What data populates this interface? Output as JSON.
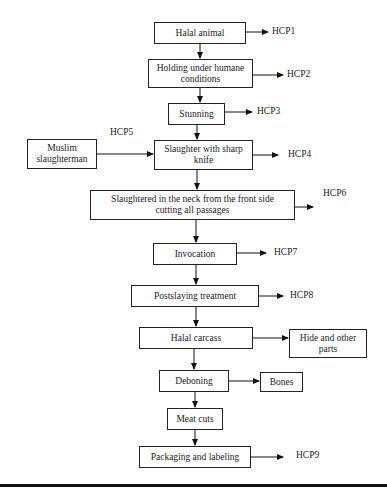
{
  "diagram": {
    "type": "flowchart",
    "steps": [
      {
        "id": "halal_animal",
        "label": "Halal animal",
        "hcp": "HCP1"
      },
      {
        "id": "holding",
        "label": "Holding under humane conditions",
        "hcp": "HCP2"
      },
      {
        "id": "stunning",
        "label": "Stunning",
        "hcp": "HCP3"
      },
      {
        "id": "slaughter",
        "label": "Slaughter with sharp knife",
        "hcp": "HCP4"
      },
      {
        "id": "neck_cut",
        "label": "Slaughtered in the neck from the front side cutting all passages",
        "hcp": "HCP6"
      },
      {
        "id": "invocation",
        "label": "Invocation",
        "hcp": "HCP7"
      },
      {
        "id": "postslaying",
        "label": "Postslaying treatment",
        "hcp": "HCP8"
      },
      {
        "id": "carcass",
        "label": "Halal carcass"
      },
      {
        "id": "deboning",
        "label": "Deboning"
      },
      {
        "id": "meat_cuts",
        "label": "Meat cuts"
      },
      {
        "id": "packaging",
        "label": "Packaging and labeling",
        "hcp": "HCP9"
      }
    ],
    "side_inputs": [
      {
        "id": "slaughterman",
        "label": "Muslim slaughterman",
        "target": "slaughter",
        "hcp": "HCP5"
      }
    ],
    "side_outputs": [
      {
        "id": "hide",
        "label": "Hide and other parts",
        "source": "carcass"
      },
      {
        "id": "bones",
        "label": "Bones",
        "source": "deboning"
      }
    ]
  },
  "text": {
    "halal_animal": "Halal animal",
    "holding_1": "Holding under humane",
    "holding_2": "conditions",
    "stunning": "Stunning",
    "slaughterman_1": "Muslim",
    "slaughterman_2": "slaughterman",
    "slaughter_1": "Slaughter with sharp",
    "slaughter_2": "knife",
    "neck_1": "Slaughtered in the neck from the front side",
    "neck_2": "cutting all passages",
    "invocation": "Invocation",
    "postslaying": "Postslaying treatment",
    "carcass": "Halal carcass",
    "hide_1": "Hide and other",
    "hide_2": "parts",
    "deboning": "Deboning",
    "bones": "Bones",
    "meat_cuts": "Meat cuts",
    "packaging": "Packaging and labeling",
    "hcp1": "HCP1",
    "hcp2": "HCP2",
    "hcp3": "HCP3",
    "hcp4": "HCP4",
    "hcp5": "HCP5",
    "hcp6": "HCP6",
    "hcp7": "HCP7",
    "hcp8": "HCP8",
    "hcp9": "HCP9"
  }
}
